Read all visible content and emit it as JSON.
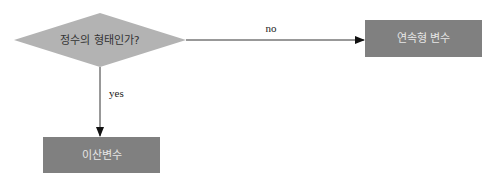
{
  "diagram": {
    "type": "flowchart",
    "nodes": [
      {
        "id": "decision",
        "shape": "diamond",
        "label": "정수의 형태인가?",
        "fill": "#b3b3b3",
        "text_color": "#333333"
      },
      {
        "id": "continuous",
        "shape": "rect",
        "label": "연속형 변수",
        "fill": "#808080",
        "text_color": "#e6e6e6"
      },
      {
        "id": "discrete",
        "shape": "rect",
        "label": "이산변수",
        "fill": "#808080",
        "text_color": "#e6e6e6"
      }
    ],
    "edges": [
      {
        "from": "decision",
        "to": "continuous",
        "label": "no"
      },
      {
        "from": "decision",
        "to": "discrete",
        "label": "yes"
      }
    ]
  }
}
